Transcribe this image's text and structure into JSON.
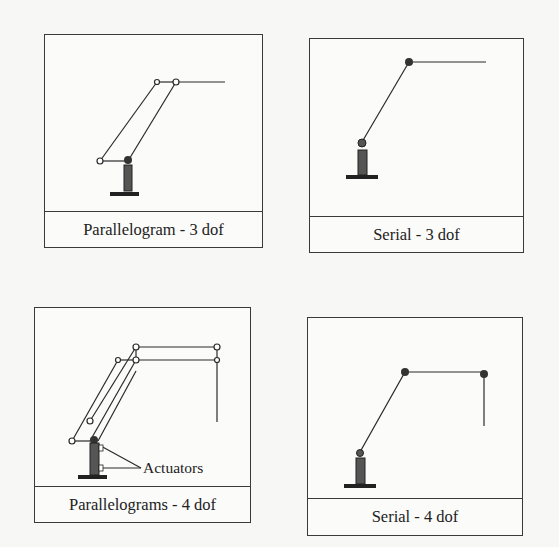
{
  "figures": [
    {
      "id": "parallelogram-3dof",
      "caption": "Parallelogram - 3 dof"
    },
    {
      "id": "serial-3dof",
      "caption": "Serial - 3 dof"
    },
    {
      "id": "parallelograms-4dof",
      "caption": "Parallelograms - 4 dof",
      "annotation": "Actuators"
    },
    {
      "id": "serial-4dof",
      "caption": "Serial - 4 dof"
    }
  ],
  "colors": {
    "ink": "#2a2a2a",
    "paper": "#f7f7f5",
    "faded_text": "#d6d6d2"
  }
}
